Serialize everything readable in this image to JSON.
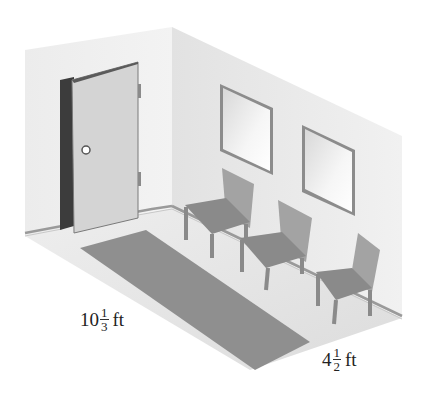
{
  "figure": {
    "dimensions": {
      "length": {
        "whole": "10",
        "numerator": "1",
        "denominator": "3",
        "unit": "ft"
      },
      "width": {
        "whole": "4",
        "numerator": "1",
        "denominator": "2",
        "unit": "ft"
      }
    },
    "objects": {
      "door_count": 1,
      "window_count": 2,
      "chair_count": 3,
      "rug_count": 1
    },
    "colors": {
      "wall_left": "#ececec",
      "wall_right": "#e4e4e4",
      "floor": "#e8e8e8",
      "rug": "#8f8f8f",
      "door": "#d2d2d2",
      "door_jamb": "#3c3c3c",
      "chair_seat": "#8a8a8a",
      "chair_back": "#a3a3a3",
      "window_frame": "#8c8c8c",
      "window_glass": "#f2f2f2"
    }
  }
}
